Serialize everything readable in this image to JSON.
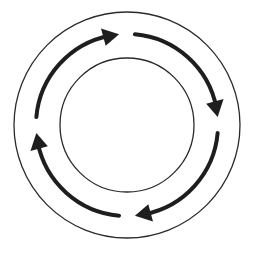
{
  "diagram": {
    "type": "cycle",
    "direction": "clockwise",
    "center": [
      127,
      125
    ],
    "outer_circle": {
      "radius": 113,
      "stroke": "#2a2a2a",
      "stroke_width": 1.3
    },
    "inner_circle": {
      "radius": 67,
      "stroke": "#2a2a2a",
      "stroke_width": 1.3
    },
    "arrows": {
      "radius": 91,
      "color": "#1e1e1e",
      "stroke_width": 4,
      "count": 4,
      "segments": [
        {
          "name": "top-arrow",
          "start_deg": 185,
          "end_deg": 265,
          "head": "pointing-right"
        },
        {
          "name": "right-arrow",
          "start_deg": 275,
          "end_deg": 355,
          "head": "pointing-down"
        },
        {
          "name": "bottom-arrow",
          "start_deg": 5,
          "end_deg": 85,
          "head": "pointing-left"
        },
        {
          "name": "left-arrow",
          "start_deg": 95,
          "end_deg": 175,
          "head": "pointing-up"
        }
      ]
    },
    "labels": []
  }
}
